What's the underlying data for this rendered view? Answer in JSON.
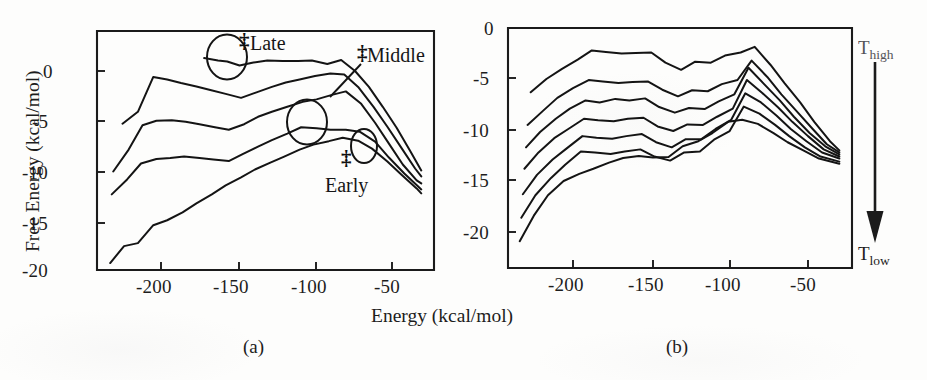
{
  "figure": {
    "width": 927,
    "height": 380,
    "background": "#fdfdfc",
    "ink_color": "#141414"
  },
  "axis_titles": {
    "x": "Energy (kcal/mol)",
    "y": "Free Energy (kcal/mol)"
  },
  "panels": [
    {
      "id": "a",
      "caption": "(a)"
    },
    {
      "id": "b",
      "caption": "(b)"
    }
  ],
  "annotations": {
    "late": {
      "label": "Late",
      "dagger": "‡"
    },
    "middle": {
      "label": "Middle",
      "dagger": "‡"
    },
    "early": {
      "label": "Early",
      "dagger": "‡"
    }
  },
  "temperature_axis": {
    "top_label": "T",
    "top_sub": "high",
    "bottom_label": "T",
    "bottom_sub": "low",
    "direction": "downward-arrow"
  },
  "chart_data": [
    {
      "type": "line",
      "panel": "(a)",
      "title": "",
      "xlabel": "Energy (kcal/mol)",
      "ylabel": "Free Energy (kcal/mol)",
      "xlim": [
        -235,
        -27
      ],
      "ylim": [
        -20,
        2.4
      ],
      "xticks": [
        -200,
        -150,
        -100,
        -50
      ],
      "yticks": [
        0,
        -5,
        -10,
        -15,
        -20
      ],
      "grid": false,
      "legend": null,
      "annotations": [
        "‡ Late",
        "‡ Middle",
        "‡ Early"
      ],
      "series": [
        {
          "name": "T_high (topmost, Late transition state)",
          "x": [
            -172,
            -163,
            -157,
            -149,
            -140,
            -131,
            -121,
            -111,
            -102,
            -92,
            -83,
            -74,
            -65,
            -56,
            -47,
            -38,
            -31
          ],
          "values": [
            1.3,
            1.05,
            0.95,
            0.55,
            0.85,
            1.05,
            1.0,
            1.0,
            1.05,
            0.7,
            1.1,
            0.0,
            -1.6,
            -3.6,
            -5.7,
            -8.1,
            -10.0
          ]
        },
        {
          "name": "T2",
          "x": [
            -225,
            -215,
            -205,
            -196,
            -187,
            -177,
            -168,
            -158,
            -148,
            -138,
            -128,
            -119,
            -110,
            -100,
            -90,
            -81,
            -72,
            -62,
            -53,
            -44,
            -35,
            -31
          ],
          "values": [
            -5.3,
            -4.1,
            -0.6,
            -0.85,
            -1.2,
            -1.55,
            -1.9,
            -2.3,
            -2.7,
            -2.15,
            -1.6,
            -1.15,
            -0.85,
            -0.5,
            -0.25,
            -0.35,
            -1.6,
            -3.6,
            -5.6,
            -7.7,
            -9.8,
            -10.6
          ]
        },
        {
          "name": "T3 (Middle transition state)",
          "x": [
            -231,
            -221,
            -212,
            -203,
            -193,
            -184,
            -175,
            -165,
            -156,
            -146,
            -137,
            -128,
            -118,
            -108,
            -99,
            -89,
            -80,
            -70,
            -61,
            -52,
            -43,
            -34,
            -31
          ],
          "values": [
            -10.1,
            -7.9,
            -5.45,
            -5.0,
            -4.95,
            -5.1,
            -5.35,
            -5.65,
            -5.9,
            -5.35,
            -4.6,
            -4.1,
            -3.6,
            -3.1,
            -2.85,
            -2.4,
            -2.05,
            -3.3,
            -5.2,
            -7.3,
            -9.4,
            -11.0,
            -11.3
          ]
        },
        {
          "name": "T4",
          "x": [
            -232,
            -222,
            -213,
            -203,
            -194,
            -185,
            -175,
            -166,
            -156,
            -147,
            -137,
            -128,
            -118,
            -109,
            -99,
            -90,
            -80,
            -71,
            -61,
            -52,
            -42,
            -33,
            -31
          ],
          "values": [
            -12.4,
            -10.9,
            -9.3,
            -8.85,
            -8.75,
            -8.6,
            -8.75,
            -8.9,
            -9.05,
            -8.35,
            -7.6,
            -6.95,
            -6.3,
            -5.65,
            -5.75,
            -5.9,
            -5.9,
            -6.1,
            -7.1,
            -8.7,
            -10.3,
            -11.6,
            -11.9
          ]
        },
        {
          "name": "T_low (bottommost, Early transition state)",
          "x": [
            -233,
            -224,
            -215,
            -205,
            -196,
            -186,
            -177,
            -167,
            -158,
            -148,
            -139,
            -129,
            -120,
            -110,
            -101,
            -91,
            -82,
            -72,
            -63,
            -53,
            -44,
            -34,
            -31
          ],
          "values": [
            -19.3,
            -17.6,
            -17.3,
            -15.5,
            -15.0,
            -14.2,
            -13.3,
            -12.4,
            -11.5,
            -10.7,
            -9.9,
            -9.2,
            -8.6,
            -7.9,
            -7.4,
            -7.05,
            -6.7,
            -7.0,
            -7.8,
            -9.1,
            -10.4,
            -11.8,
            -12.3
          ]
        }
      ]
    },
    {
      "type": "line",
      "panel": "(b)",
      "title": "",
      "xlabel": "Energy (kcal/mol)",
      "ylabel": "Free Energy (kcal/mol)",
      "xlim": [
        -237,
        -27
      ],
      "ylim": [
        -21.5,
        0
      ],
      "xticks": [
        -200,
        -150,
        -100,
        -50
      ],
      "yticks": [
        0,
        -5,
        -10,
        -15,
        -20
      ],
      "grid": false,
      "legend": null,
      "annotations": [
        "T_high",
        "T_low"
      ],
      "series": [
        {
          "name": "T_high (topmost)",
          "x": [
            -227,
            -217,
            -207,
            -197,
            -188,
            -179,
            -169,
            -160,
            -150,
            -141,
            -131,
            -122,
            -112,
            -103,
            -93,
            -84,
            -74,
            -65,
            -55,
            -46,
            -36,
            -30
          ],
          "values": [
            -6.3,
            -5.0,
            -4.0,
            -3.1,
            -2.2,
            -2.35,
            -2.5,
            -2.45,
            -2.4,
            -3.4,
            -4.1,
            -3.3,
            -3.4,
            -2.7,
            -2.4,
            -1.85,
            -3.6,
            -5.4,
            -7.3,
            -9.2,
            -11.1,
            -12.0
          ]
        },
        {
          "name": "T2",
          "x": [
            -229,
            -219,
            -210,
            -200,
            -190,
            -181,
            -171,
            -162,
            -152,
            -143,
            -133,
            -124,
            -114,
            -105,
            -95,
            -86,
            -76,
            -67,
            -57,
            -47,
            -38,
            -30
          ],
          "values": [
            -9.5,
            -8.1,
            -6.85,
            -5.9,
            -5.1,
            -5.25,
            -5.4,
            -5.3,
            -5.25,
            -6.05,
            -6.7,
            -6.1,
            -6.2,
            -5.5,
            -5.1,
            -3.2,
            -4.8,
            -6.5,
            -8.2,
            -9.9,
            -11.4,
            -12.2
          ]
        },
        {
          "name": "T3",
          "x": [
            -230,
            -221,
            -211,
            -202,
            -192,
            -183,
            -173,
            -164,
            -154,
            -145,
            -135,
            -126,
            -116,
            -107,
            -97,
            -88,
            -78,
            -68,
            -59,
            -49,
            -39,
            -30
          ],
          "values": [
            -11.7,
            -10.2,
            -8.9,
            -7.9,
            -7.1,
            -7.3,
            -6.95,
            -7.1,
            -6.9,
            -7.75,
            -8.3,
            -7.85,
            -7.95,
            -7.2,
            -6.5,
            -3.9,
            -5.5,
            -7.1,
            -8.7,
            -10.3,
            -11.6,
            -12.4
          ]
        },
        {
          "name": "T4",
          "x": [
            -231,
            -222,
            -212,
            -203,
            -193,
            -184,
            -174,
            -165,
            -155,
            -146,
            -136,
            -127,
            -117,
            -108,
            -98,
            -89,
            -79,
            -69,
            -60,
            -50,
            -40,
            -30
          ],
          "values": [
            -13.8,
            -12.2,
            -10.8,
            -9.9,
            -8.9,
            -9.05,
            -9.15,
            -8.9,
            -8.8,
            -9.65,
            -10.1,
            -9.45,
            -9.5,
            -8.7,
            -7.9,
            -5.1,
            -6.4,
            -7.8,
            -9.2,
            -10.6,
            -11.9,
            -12.6
          ]
        },
        {
          "name": "T5",
          "x": [
            -232,
            -223,
            -213,
            -204,
            -194,
            -185,
            -175,
            -166,
            -156,
            -147,
            -137,
            -128,
            -118,
            -109,
            -99,
            -90,
            -80,
            -70,
            -61,
            -51,
            -41,
            -30
          ],
          "values": [
            -16.3,
            -14.4,
            -12.9,
            -11.8,
            -10.6,
            -10.75,
            -10.85,
            -10.6,
            -10.4,
            -11.2,
            -11.7,
            -10.9,
            -10.9,
            -9.9,
            -9.0,
            -6.4,
            -7.3,
            -8.6,
            -9.9,
            -11.1,
            -12.2,
            -12.8
          ]
        },
        {
          "name": "T6",
          "x": [
            -233,
            -224,
            -214,
            -205,
            -195,
            -186,
            -176,
            -167,
            -157,
            -148,
            -138,
            -129,
            -119,
            -110,
            -100,
            -91,
            -81,
            -71,
            -62,
            -52,
            -42,
            -30
          ],
          "values": [
            -18.6,
            -16.4,
            -14.7,
            -13.4,
            -12.1,
            -12.2,
            -12.35,
            -12.1,
            -11.9,
            -12.6,
            -13.0,
            -12.2,
            -12.1,
            -10.95,
            -10.1,
            -7.7,
            -8.4,
            -9.5,
            -10.6,
            -11.7,
            -12.6,
            -13.1
          ]
        },
        {
          "name": "T_low (bottommost)",
          "x": [
            -234,
            -225,
            -216,
            -206,
            -196,
            -187,
            -177,
            -168,
            -158,
            -149,
            -139,
            -130,
            -120,
            -111,
            -101,
            -92,
            -82,
            -72,
            -63,
            -53,
            -43,
            -30
          ],
          "values": [
            -20.9,
            -18.4,
            -16.4,
            -15.0,
            -14.3,
            -13.8,
            -13.2,
            -12.75,
            -12.55,
            -12.7,
            -12.65,
            -11.6,
            -11.1,
            -10.3,
            -9.2,
            -9.0,
            -9.4,
            -10.3,
            -11.2,
            -12.0,
            -12.8,
            -13.3
          ]
        }
      ]
    }
  ]
}
